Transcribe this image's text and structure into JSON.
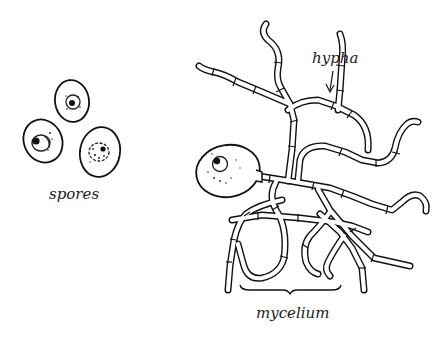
{
  "figure": {
    "labels": {
      "spores": "spores",
      "hypha": "hypha",
      "mycelium": "mycelium"
    },
    "colors": {
      "ink": "#111111",
      "background": "#ffffff"
    },
    "spores": [
      {
        "name": "spore-top",
        "cx": 72,
        "cy": 102,
        "rx": 17,
        "ry": 21
      },
      {
        "name": "spore-left",
        "cx": 43,
        "cy": 141,
        "rx": 19,
        "ry": 22
      },
      {
        "name": "spore-right",
        "cx": 100,
        "cy": 152,
        "rx": 20,
        "ry": 25
      }
    ],
    "germinating_spore": {
      "cx": 228,
      "cy": 172,
      "rx": 32,
      "ry": 26
    }
  }
}
